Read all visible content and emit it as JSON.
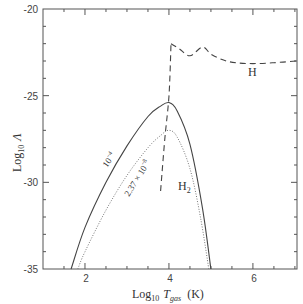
{
  "chart_data": {
    "type": "line",
    "title": "",
    "xlabel": "Log10 Tgas (K)",
    "ylabel": "Log10 Λ",
    "xlabel_parts": {
      "log": "Log",
      "sub": "10",
      "var": "T",
      "varsub": "gas",
      "unit": "(K)"
    },
    "ylabel_parts": {
      "log": "Log",
      "sub": "10",
      "var": "Λ"
    },
    "xlim": [
      1.0,
      7.05
    ],
    "ylim": [
      -35,
      -20
    ],
    "xticks": [
      2,
      4,
      6
    ],
    "xtick_labels": [
      "2",
      "4",
      "6"
    ],
    "yticks": [
      -20,
      -25,
      -30,
      -35
    ],
    "ytick_labels": [
      "-20",
      "-25",
      "-30",
      "-35"
    ],
    "grid": false,
    "legend": null,
    "series": [
      {
        "name": "10^-4",
        "label": "10⁻⁴",
        "style": "solid",
        "x": [
          1.67,
          2.0,
          2.5,
          3.0,
          3.5,
          3.8,
          4.0,
          4.2,
          4.5,
          4.8,
          5.0
        ],
        "y": [
          -35.0,
          -32.6,
          -30.0,
          -27.9,
          -26.2,
          -25.6,
          -25.4,
          -25.9,
          -27.8,
          -31.5,
          -35.0
        ]
      },
      {
        "name": "2.37 x 10^-8",
        "label": "2.37 × 10⁻⁸",
        "style": "dotted",
        "x": [
          1.83,
          2.0,
          2.5,
          3.0,
          3.5,
          3.8,
          4.0,
          4.2,
          4.5,
          4.75,
          4.95
        ],
        "y": [
          -35.0,
          -34.0,
          -31.6,
          -29.6,
          -28.0,
          -27.3,
          -27.0,
          -27.4,
          -29.2,
          -32.0,
          -35.0
        ]
      },
      {
        "name": "H2",
        "label": "H₂",
        "style": "dashed",
        "x": [
          3.8,
          3.9,
          4.0,
          4.05
        ],
        "y": [
          -30.5,
          -27.5,
          -25.0,
          -22.0
        ]
      },
      {
        "name": "H",
        "label": "H",
        "style": "dashed",
        "x": [
          4.05,
          4.25,
          4.5,
          4.8,
          5.0,
          5.3,
          5.6,
          6.0,
          6.5,
          7.05
        ],
        "y": [
          -22.0,
          -22.3,
          -22.7,
          -22.2,
          -22.6,
          -22.95,
          -23.1,
          -23.15,
          -23.1,
          -23.0
        ]
      }
    ],
    "annotations": [
      {
        "text": "H",
        "x": 6.2,
        "y": -25.2
      },
      {
        "text": "H₂",
        "x": 4.2,
        "y": -30.2
      },
      {
        "text": "10⁻⁴",
        "x": 2.75,
        "y": -28.3,
        "rotation": -55
      },
      {
        "text": "2.37 × 10⁻⁸",
        "x": 3.2,
        "y": -29.8,
        "rotation": -58
      }
    ]
  },
  "labels": {
    "y_ticks": [
      "-20",
      "-25",
      "-30",
      "-35"
    ],
    "x_ticks": [
      "2",
      "4",
      "6"
    ],
    "x_title_log": "Log",
    "x_title_sub": "10",
    "x_title_var": "T",
    "x_title_varsub": "gas",
    "x_title_unit": "(K)",
    "y_title_log": "Log",
    "y_title_sub": "10",
    "y_title_var": "Λ",
    "ann_H": "H",
    "ann_H2": "H",
    "ann_H2_sub": "2",
    "ann_solid": "10",
    "ann_solid_exp": "−4",
    "ann_dotted": "2.37 × 10",
    "ann_dotted_exp": "−8"
  }
}
